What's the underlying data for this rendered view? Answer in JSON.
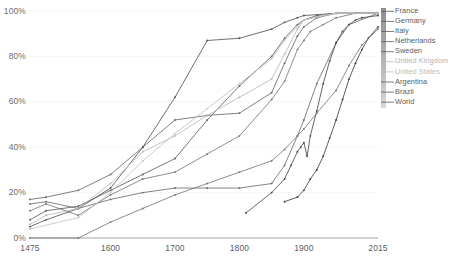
{
  "chart_data": {
    "type": "line",
    "title": "",
    "subtitle": "",
    "xlabel": "",
    "ylabel": "",
    "xlim": [
      1475,
      2015
    ],
    "ylim": [
      0,
      100
    ],
    "grid": true,
    "legend_position": "right",
    "x_ticks": [
      "1475",
      "1600",
      "1700",
      "1800",
      "1900",
      "2015"
    ],
    "x_tick_values": [
      1475,
      1600,
      1700,
      1800,
      1900,
      2015
    ],
    "y_ticks": [
      "0%",
      "20%",
      "40%",
      "60%",
      "80%",
      "100%"
    ],
    "y_tick_values": [
      0,
      20,
      40,
      60,
      80,
      100
    ],
    "series": [
      {
        "name": "France",
        "color": "#7a7a7a",
        "points": [
          [
            1475,
            12
          ],
          [
            1500,
            15
          ],
          [
            1550,
            10
          ],
          [
            1600,
            19
          ],
          [
            1650,
            26
          ],
          [
            1700,
            29
          ],
          [
            1750,
            37
          ],
          [
            1800,
            45
          ],
          [
            1850,
            61
          ],
          [
            1870,
            69
          ],
          [
            1890,
            83
          ],
          [
            1900,
            87
          ],
          [
            1910,
            91
          ],
          [
            1930,
            94
          ],
          [
            1950,
            97
          ],
          [
            1980,
            99
          ],
          [
            2015,
            99
          ]
        ]
      },
      {
        "name": "Germany",
        "color": "#5f5f5f",
        "points": [
          [
            1475,
            8
          ],
          [
            1500,
            12
          ],
          [
            1550,
            14
          ],
          [
            1600,
            21
          ],
          [
            1650,
            28
          ],
          [
            1700,
            35
          ],
          [
            1750,
            52
          ],
          [
            1800,
            67
          ],
          [
            1850,
            80
          ],
          [
            1870,
            88
          ],
          [
            1890,
            94
          ],
          [
            1900,
            96
          ],
          [
            1920,
            98
          ],
          [
            1950,
            99
          ],
          [
            2015,
            99
          ]
        ]
      },
      {
        "name": "Italy",
        "color": "#6e6e6e",
        "points": [
          [
            1475,
            15
          ],
          [
            1500,
            16
          ],
          [
            1550,
            13
          ],
          [
            1600,
            17
          ],
          [
            1650,
            20
          ],
          [
            1700,
            22
          ],
          [
            1750,
            22
          ],
          [
            1800,
            22
          ],
          [
            1850,
            24
          ],
          [
            1870,
            32
          ],
          [
            1890,
            45
          ],
          [
            1900,
            52
          ],
          [
            1920,
            68
          ],
          [
            1950,
            86
          ],
          [
            1970,
            94
          ],
          [
            2015,
            99
          ]
        ]
      },
      {
        "name": "Netherlands",
        "color": "#6a6a6a",
        "points": [
          [
            1475,
            17
          ],
          [
            1500,
            18
          ],
          [
            1550,
            21
          ],
          [
            1600,
            28
          ],
          [
            1650,
            40
          ],
          [
            1700,
            52
          ],
          [
            1750,
            54
          ],
          [
            1800,
            55
          ],
          [
            1850,
            64
          ],
          [
            1870,
            77
          ],
          [
            1890,
            89
          ],
          [
            1900,
            93
          ],
          [
            1920,
            97
          ],
          [
            1950,
            99
          ],
          [
            2015,
            99
          ]
        ]
      },
      {
        "name": "Sweden",
        "color": "#555555",
        "points": [
          [
            1475,
            5
          ],
          [
            1500,
            8
          ],
          [
            1550,
            13
          ],
          [
            1600,
            22
          ],
          [
            1650,
            40
          ],
          [
            1700,
            62
          ],
          [
            1750,
            87
          ],
          [
            1800,
            88
          ],
          [
            1850,
            92
          ],
          [
            1870,
            95
          ],
          [
            1890,
            97
          ],
          [
            1900,
            98
          ],
          [
            1950,
            99
          ],
          [
            2015,
            99
          ]
        ]
      },
      {
        "name": "United Kingdom",
        "color": "#b9b9b9",
        "points": [
          [
            1475,
            6
          ],
          [
            1500,
            10
          ],
          [
            1550,
            13
          ],
          [
            1600,
            24
          ],
          [
            1650,
            38
          ],
          [
            1700,
            45
          ],
          [
            1750,
            54
          ],
          [
            1800,
            62
          ],
          [
            1850,
            70
          ],
          [
            1870,
            81
          ],
          [
            1890,
            92
          ],
          [
            1900,
            96
          ],
          [
            1930,
            98
          ],
          [
            1950,
            99
          ],
          [
            2015,
            99
          ]
        ]
      },
      {
        "name": "United States",
        "color": "#c2c2c2",
        "points": [
          [
            1475,
            4
          ],
          [
            1550,
            9
          ],
          [
            1600,
            20
          ],
          [
            1650,
            34
          ],
          [
            1700,
            46
          ],
          [
            1750,
            57
          ],
          [
            1800,
            68
          ],
          [
            1850,
            79
          ],
          [
            1870,
            87
          ],
          [
            1890,
            93
          ],
          [
            1900,
            96
          ],
          [
            1930,
            98
          ],
          [
            1950,
            99
          ],
          [
            2015,
            99
          ]
        ]
      },
      {
        "name": "Argentina",
        "color": "#4a4a4a",
        "points": [
          [
            1810,
            11
          ],
          [
            1850,
            20
          ],
          [
            1870,
            26
          ],
          [
            1880,
            32
          ],
          [
            1890,
            38
          ],
          [
            1895,
            40
          ],
          [
            1900,
            42
          ],
          [
            1905,
            36
          ],
          [
            1910,
            45
          ],
          [
            1920,
            56
          ],
          [
            1930,
            68
          ],
          [
            1940,
            78
          ],
          [
            1950,
            86
          ],
          [
            1960,
            91
          ],
          [
            1970,
            94
          ],
          [
            1980,
            96
          ],
          [
            1990,
            97
          ],
          [
            2015,
            98
          ]
        ]
      },
      {
        "name": "Brazil",
        "color": "#3f3f3f",
        "points": [
          [
            1870,
            16
          ],
          [
            1890,
            18
          ],
          [
            1900,
            21
          ],
          [
            1910,
            26
          ],
          [
            1920,
            30
          ],
          [
            1930,
            36
          ],
          [
            1940,
            44
          ],
          [
            1950,
            52
          ],
          [
            1960,
            61
          ],
          [
            1970,
            70
          ],
          [
            1980,
            77
          ],
          [
            1990,
            83
          ],
          [
            2000,
            88
          ],
          [
            2015,
            93
          ]
        ]
      },
      {
        "name": "World",
        "color": "#787878",
        "points": [
          [
            1475,
            0
          ],
          [
            1550,
            0
          ],
          [
            1600,
            7
          ],
          [
            1650,
            13
          ],
          [
            1700,
            19
          ],
          [
            1750,
            24
          ],
          [
            1800,
            29
          ],
          [
            1850,
            34
          ],
          [
            1870,
            39
          ],
          [
            1890,
            45
          ],
          [
            1900,
            48
          ],
          [
            1920,
            55
          ],
          [
            1950,
            65
          ],
          [
            1970,
            76
          ],
          [
            1990,
            85
          ],
          [
            2015,
            92
          ]
        ]
      }
    ]
  },
  "legend": {
    "items": [
      {
        "label": "France",
        "color": "#5a5a5a"
      },
      {
        "label": "Germany",
        "color": "#5a5a5a"
      },
      {
        "label": "Italy",
        "color": "#5a5a5a"
      },
      {
        "label": "Netherlands",
        "color": "#5a5a5a"
      },
      {
        "label": "Sweden",
        "color": "#5a5a5a"
      },
      {
        "label": "United Kingdom",
        "color": "#b4b4b4"
      },
      {
        "label": "United States",
        "color": "#bcbcbc"
      },
      {
        "label": "Argentina",
        "color": "#5a5a5a"
      },
      {
        "label": "Brazil",
        "color": "#5a5a5a"
      },
      {
        "label": "World",
        "color": "#5a5a5a"
      }
    ]
  },
  "axes": {
    "grid_color": "#dcdcdc",
    "axis_color": "#9a9a9a",
    "tick_text_color": "#6d6d6d"
  }
}
